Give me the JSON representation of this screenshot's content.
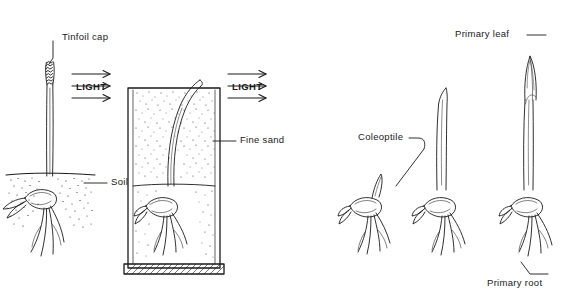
{
  "figure": {
    "ink_color": "#1a1a1a",
    "background": "#ffffff"
  },
  "labels": {
    "tinfoil_cap": "Tinfoil cap",
    "light_left": "LIGHT",
    "light_right": "LIGHT",
    "fine_sand": "Fine sand",
    "soil": "Soil",
    "coleoptile": "Coleoptile",
    "primary_leaf": "Primary leaf",
    "primary_root": "Primary root"
  },
  "panels": [
    {
      "name": "panel-left-tinfoil",
      "description": "Seedling in soil with tinfoil cap on coleoptile tip, light arrows from left, shoot grows straight up"
    },
    {
      "name": "panel-sand-beaker",
      "description": "Seedling in beaker of fine sand over soil, light arrows from left, coleoptile curves toward light"
    },
    {
      "name": "panel-stage-1",
      "description": "Germinating seedling, emerging coleoptile, roots"
    },
    {
      "name": "panel-stage-2",
      "description": "Elongated coleoptile with roots"
    },
    {
      "name": "panel-stage-3",
      "description": "Coleoptile with primary leaf emerging at tip"
    }
  ],
  "arrows": {
    "left_group_count": 3,
    "right_group_count": 3,
    "direction": "pointing right (light source from left)"
  }
}
